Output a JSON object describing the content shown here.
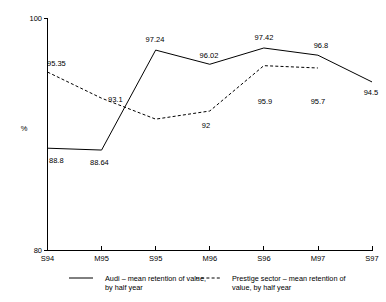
{
  "chart_data": {
    "type": "line",
    "title": "",
    "xlabel": "",
    "ylabel": "%",
    "ylim": [
      80,
      100
    ],
    "ytick_labels": [
      "100",
      "80"
    ],
    "grid": false,
    "legend_position": "bottom",
    "categories": [
      "S94",
      "M95",
      "S95",
      "M96",
      "S96",
      "M97",
      "S97"
    ],
    "series": [
      {
        "name": "Audi – mean retention of value, by half year",
        "style": "solid",
        "values": [
          88.8,
          88.64,
          97.24,
          96.02,
          97.42,
          96.8,
          94.5
        ],
        "point_labels": [
          "88.8",
          "88.64",
          "97.24",
          "96.02",
          "97.42",
          "96.8",
          "94.5"
        ]
      },
      {
        "name": "Prestige sector – mean retention of value, by half year",
        "style": "dashed",
        "values": [
          95.35,
          93.1,
          91.3,
          92.0,
          95.9,
          95.7,
          null
        ],
        "point_labels": [
          "95.35",
          "93.1",
          "",
          "92",
          "95.9",
          "95.7",
          ""
        ]
      }
    ]
  },
  "axes": {
    "y_top_label": "100",
    "y_bottom_label": "80",
    "y_axis_title": "%"
  },
  "x_labels": {
    "t0": "S94",
    "t1": "M95",
    "t2": "S95",
    "t3": "M96",
    "t4": "S96",
    "t5": "M97",
    "t6": "S97"
  },
  "point_labels": {
    "audi_s94": "88.8",
    "audi_m95": "88.64",
    "audi_s95": "97.24",
    "audi_m96": "96.02",
    "audi_s96": "97.42",
    "audi_m97": "96.8",
    "audi_s97": "94.5",
    "prestige_s94": "95.35",
    "prestige_m95": "93.1",
    "prestige_m96": "92",
    "prestige_s96": "95.9",
    "prestige_m97": "95.7"
  },
  "legend": {
    "audi_line1": "Audi – mean retention of value,",
    "audi_line2": "by half year",
    "prestige_line1": "Prestige sector – mean retention of",
    "prestige_line2": "value, by half year"
  },
  "colors": {
    "ink": "#000000",
    "background": "#ffffff"
  }
}
